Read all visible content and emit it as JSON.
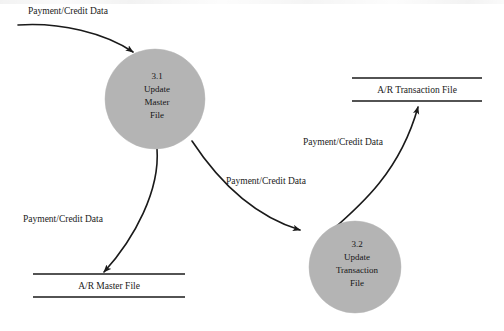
{
  "diagram": {
    "type": "data-flow-diagram",
    "title": "",
    "background_color": "#ffffff",
    "process_fill_color": "#b4b4b4",
    "line_color": "#1a1a1a",
    "processes": [
      {
        "id": "3.1",
        "number": "3.1",
        "name_lines": [
          "Update",
          "Master",
          "File"
        ],
        "line1": "3.1",
        "line2": "Update",
        "line3": "Master",
        "line4": "File",
        "cx": 155,
        "cy": 99,
        "r": 50
      },
      {
        "id": "3.2",
        "number": "3.2",
        "name_lines": [
          "Update",
          "Transaction",
          "File"
        ],
        "line1": "3.2",
        "line2": "Update",
        "line3": "Transaction",
        "line4": "File",
        "cx": 355,
        "cy": 267,
        "r": 46
      }
    ],
    "data_stores": [
      {
        "id": "ar-master-file",
        "label": "A/R Master File"
      },
      {
        "id": "ar-transaction-file",
        "label": "A/R Transaction File"
      }
    ],
    "data_flows": [
      {
        "id": "external-to-31",
        "label": "Payment/Credit Data",
        "from": "external-source",
        "to": "3.1"
      },
      {
        "id": "31-to-master-file",
        "label": "Payment/Credit Data",
        "from": "3.1",
        "to": "ar-master-file"
      },
      {
        "id": "31-to-32",
        "label": "Payment/Credit Data",
        "from": "3.1",
        "to": "3.2"
      },
      {
        "id": "32-to-transaction-file",
        "label": "Payment/Credit Data",
        "from": "3.2",
        "to": "ar-transaction-file"
      }
    ]
  }
}
